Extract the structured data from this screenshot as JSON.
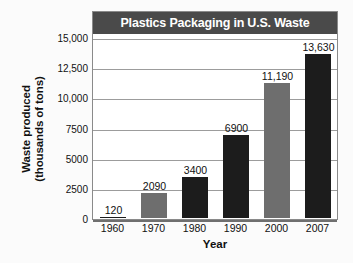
{
  "chart_data": {
    "type": "bar",
    "title": "Plastics Packaging in U.S. Waste",
    "xlabel": "Year",
    "ylabel_line1": "Waste produced",
    "ylabel_line2": "(thousands of tons)",
    "categories": [
      "1960",
      "1970",
      "1980",
      "1990",
      "2000",
      "2007"
    ],
    "values": [
      120,
      2090,
      3400,
      6900,
      11190,
      13630
    ],
    "value_labels": [
      "120",
      "2090",
      "3400",
      "6900",
      "11,190",
      "13,630"
    ],
    "bar_tones": [
      "dark",
      "gray",
      "dark",
      "dark",
      "gray",
      "dark"
    ],
    "ylim": [
      0,
      15000
    ],
    "yticks": [
      0,
      2500,
      5000,
      7500,
      10000,
      12500,
      15000
    ],
    "ytick_labels": [
      "0",
      "2500",
      "5000",
      "7500",
      "10,000",
      "12,500",
      "15,000"
    ],
    "grid": true,
    "legend": "none",
    "colors": {
      "bar_dark": "#1c1c1c",
      "bar_gray": "#6e6e6e",
      "title_band": "#4a4a4a",
      "title_text": "#ffffff",
      "gridline": "#9c9c9c",
      "frame": "#8a8a8a",
      "plot_background": "#ffffff",
      "page_background": "#fbfbfb",
      "text": "#111111"
    }
  }
}
